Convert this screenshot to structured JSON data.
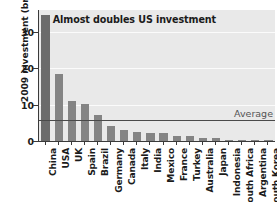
{
  "chart_data": {
    "type": "bar",
    "title": "",
    "xlabel": "",
    "ylabel": "2009 investment (bn US$)",
    "ylim": [
      0,
      36
    ],
    "yticks": [
      0,
      10,
      20,
      30
    ],
    "grid": true,
    "legend": null,
    "categories": [
      "China",
      "USA",
      "UK",
      "Spain",
      "Brazil",
      "Germany",
      "Canada",
      "Italy",
      "India",
      "Mexico",
      "France",
      "Turkey",
      "Australia",
      "Japan",
      "Indonesia",
      "South Africa",
      "Argentina",
      "South Korea"
    ],
    "values": [
      34.5,
      18.4,
      10.9,
      10.1,
      7.2,
      4.0,
      3.0,
      2.4,
      2.2,
      2.1,
      1.5,
      1.3,
      0.9,
      0.8,
      0.4,
      0.35,
      0.3,
      0.25
    ],
    "highlight_category": "China",
    "annotations": [
      {
        "text": "Almost doubles US investment",
        "target": "China"
      },
      {
        "text": "Average",
        "value": 5.8,
        "type": "reference-line"
      }
    ],
    "reference_line": {
      "label": "Average",
      "value": 5.8
    }
  },
  "colors": {
    "bar": "#848484",
    "bar_highlight": "#6b6b6b",
    "plot_background": "#e9e9e9",
    "gridline": "#fbfbfb",
    "axis": "#3a3a3a",
    "average_line": "#4a4a4a",
    "text": "#1b1b1b",
    "average_label": "#555555"
  }
}
